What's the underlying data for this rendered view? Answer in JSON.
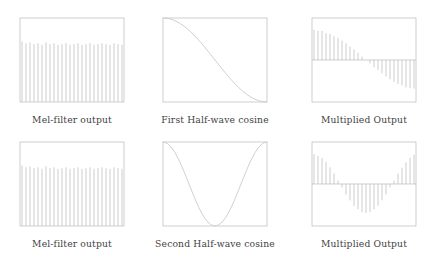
{
  "figure": {
    "title": "",
    "background_color": "#ffffff",
    "axis_color": "#b9b9b9",
    "stem_color": "#c4c4c4",
    "curve_color": "#cbcbcb",
    "caption_color": "#3f3f3f"
  },
  "panels": [
    {
      "id": "mel-filter-output-row1",
      "caption": "Mel-filter output",
      "plot_name": "mel-filter-output-plot-1"
    },
    {
      "id": "first-half-wave-cosine",
      "caption": "First Half-wave cosine",
      "plot_name": "first-half-wave-cosine-plot"
    },
    {
      "id": "multiplied-output-row1",
      "caption": "Multiplied Output",
      "plot_name": "multiplied-output-plot-1"
    },
    {
      "id": "mel-filter-output-row2",
      "caption": "Mel-filter output",
      "plot_name": "mel-filter-output-plot-2"
    },
    {
      "id": "second-half-wave-cosine",
      "caption": "Second Half-wave cosine",
      "plot_name": "second-half-wave-cosine-plot"
    },
    {
      "id": "multiplied-output-row2",
      "caption": "Multiplied Output",
      "plot_name": "multiplied-output-plot-2"
    }
  ],
  "chart_data": [
    {
      "type": "bar",
      "title": "Mel-filter output",
      "xlabel": "",
      "ylabel": "",
      "ylim": [
        0,
        1
      ],
      "xlim": [
        0,
        26
      ],
      "grid": false,
      "legend": null,
      "baseline": 0,
      "categories": [
        1,
        2,
        3,
        4,
        5,
        6,
        7,
        8,
        9,
        10,
        11,
        12,
        13,
        14,
        15,
        16,
        17,
        18,
        19,
        20,
        21,
        22,
        23,
        24,
        25,
        26
      ],
      "values": [
        0.72,
        0.7,
        0.71,
        0.69,
        0.7,
        0.68,
        0.71,
        0.69,
        0.7,
        0.68,
        0.69,
        0.7,
        0.68,
        0.69,
        0.7,
        0.68,
        0.69,
        0.7,
        0.68,
        0.69,
        0.7,
        0.69,
        0.68,
        0.7,
        0.69,
        0.68
      ]
    },
    {
      "type": "line",
      "title": "First Half-wave cosine",
      "xlabel": "",
      "ylabel": "",
      "ylim": [
        -1,
        1
      ],
      "xlim": [
        0,
        26
      ],
      "grid": false,
      "legend": null,
      "x": [
        0,
        1,
        2,
        3,
        4,
        5,
        6,
        7,
        8,
        9,
        10,
        11,
        12,
        13,
        14,
        15,
        16,
        17,
        18,
        19,
        20,
        21,
        22,
        23,
        24,
        25,
        26
      ],
      "values": [
        1.0,
        0.993,
        0.971,
        0.935,
        0.885,
        0.823,
        0.749,
        0.663,
        0.568,
        0.465,
        0.355,
        0.239,
        0.12,
        0.0,
        -0.12,
        -0.239,
        -0.355,
        -0.465,
        -0.568,
        -0.663,
        -0.749,
        -0.823,
        -0.885,
        -0.935,
        -0.971,
        -0.993,
        -1.0
      ]
    },
    {
      "type": "bar",
      "title": "Multiplied Output",
      "xlabel": "",
      "ylabel": "",
      "ylim": [
        -1,
        1
      ],
      "xlim": [
        0,
        26
      ],
      "grid": false,
      "legend": null,
      "baseline": 0,
      "categories": [
        1,
        2,
        3,
        4,
        5,
        6,
        7,
        8,
        9,
        10,
        11,
        12,
        13,
        14,
        15,
        16,
        17,
        18,
        19,
        20,
        21,
        22,
        23,
        24,
        25,
        26
      ],
      "values": [
        0.72,
        0.69,
        0.69,
        0.64,
        0.62,
        0.56,
        0.53,
        0.46,
        0.4,
        0.32,
        0.25,
        0.17,
        0.08,
        0.0,
        -0.08,
        -0.17,
        -0.24,
        -0.32,
        -0.39,
        -0.46,
        -0.52,
        -0.57,
        -0.6,
        -0.65,
        -0.67,
        -0.68
      ]
    },
    {
      "type": "bar",
      "title": "Mel-filter output",
      "xlabel": "",
      "ylabel": "",
      "ylim": [
        0,
        1
      ],
      "xlim": [
        0,
        26
      ],
      "grid": false,
      "legend": null,
      "baseline": 0,
      "categories": [
        1,
        2,
        3,
        4,
        5,
        6,
        7,
        8,
        9,
        10,
        11,
        12,
        13,
        14,
        15,
        16,
        17,
        18,
        19,
        20,
        21,
        22,
        23,
        24,
        25,
        26
      ],
      "values": [
        0.72,
        0.7,
        0.71,
        0.69,
        0.7,
        0.68,
        0.71,
        0.69,
        0.7,
        0.68,
        0.69,
        0.7,
        0.68,
        0.69,
        0.7,
        0.68,
        0.69,
        0.7,
        0.68,
        0.69,
        0.7,
        0.69,
        0.68,
        0.7,
        0.69,
        0.68
      ]
    },
    {
      "type": "line",
      "title": "Second Half-wave cosine",
      "xlabel": "",
      "ylabel": "",
      "ylim": [
        -1,
        1
      ],
      "xlim": [
        0,
        26
      ],
      "grid": false,
      "legend": null,
      "x": [
        0,
        1,
        2,
        3,
        4,
        5,
        6,
        7,
        8,
        9,
        10,
        11,
        12,
        13,
        14,
        15,
        16,
        17,
        18,
        19,
        20,
        21,
        22,
        23,
        24,
        25,
        26
      ],
      "values": [
        1.0,
        0.971,
        0.885,
        0.749,
        0.568,
        0.355,
        0.12,
        -0.12,
        -0.355,
        -0.568,
        -0.749,
        -0.885,
        -0.971,
        -1.0,
        -0.971,
        -0.885,
        -0.749,
        -0.568,
        -0.355,
        -0.12,
        0.12,
        0.355,
        0.568,
        0.749,
        0.885,
        0.971,
        1.0
      ]
    },
    {
      "type": "bar",
      "title": "Multiplied Output",
      "xlabel": "",
      "ylabel": "",
      "ylim": [
        -1,
        1
      ],
      "xlim": [
        0,
        26
      ],
      "grid": false,
      "legend": null,
      "baseline": 0,
      "categories": [
        1,
        2,
        3,
        4,
        5,
        6,
        7,
        8,
        9,
        10,
        11,
        12,
        13,
        14,
        15,
        16,
        17,
        18,
        19,
        20,
        21,
        22,
        23,
        24,
        25,
        26
      ],
      "values": [
        0.71,
        0.67,
        0.62,
        0.53,
        0.4,
        0.25,
        0.08,
        -0.08,
        -0.25,
        -0.39,
        -0.52,
        -0.6,
        -0.67,
        -0.69,
        -0.67,
        -0.6,
        -0.52,
        -0.39,
        -0.25,
        -0.08,
        0.08,
        0.25,
        0.39,
        0.52,
        0.62,
        0.7
      ]
    }
  ]
}
